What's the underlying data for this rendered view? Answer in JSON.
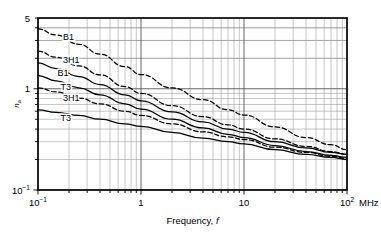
{
  "chart_data": {
    "type": "line",
    "title": "",
    "xlabel": "Frequency, f",
    "ylabel": "n_a",
    "xlabel_text": "Frequency,",
    "xlabel_symbol": "f",
    "xscale": "log",
    "yscale": "log",
    "xlim": [
      0.1,
      100
    ],
    "ylim": [
      0.1,
      5
    ],
    "xunit": "MHz",
    "grid": true,
    "legend_position": "inline-labels",
    "xticks": [
      {
        "value": 0.1,
        "label": "10",
        "sup": "-1"
      },
      {
        "value": 1,
        "label": "1",
        "sup": ""
      },
      {
        "value": 10,
        "label": "10",
        "sup": ""
      },
      {
        "value": 100,
        "label": "10",
        "sup": "2"
      }
    ],
    "yticks": [
      {
        "value": 5,
        "label": "5",
        "sup": ""
      },
      {
        "value": 1,
        "label": "1",
        "sup": ""
      },
      {
        "value": 0.1,
        "label": "10",
        "sup": "-1"
      }
    ],
    "series": [
      {
        "name": "B1",
        "style": "dashed",
        "label": "B1",
        "label_x": 0.175,
        "label_y": 3.05,
        "x": [
          0.1,
          0.15,
          0.25,
          0.4,
          0.7,
          1.0,
          2.0,
          4.0,
          7.0,
          10.0,
          20.0,
          40.0,
          70.0,
          100.0
        ],
        "y": [
          3.9,
          3.4,
          2.75,
          2.2,
          1.65,
          1.38,
          1.02,
          0.78,
          0.62,
          0.55,
          0.42,
          0.33,
          0.28,
          0.25
        ]
      },
      {
        "name": "3H1-upper",
        "style": "dashed",
        "label": "3H1",
        "label_x": 0.175,
        "label_y": 1.8,
        "x": [
          0.1,
          0.15,
          0.25,
          0.4,
          0.7,
          1.0,
          2.0,
          4.0,
          7.0,
          10.0,
          20.0,
          40.0,
          70.0,
          100.0
        ],
        "y": [
          2.35,
          2.05,
          1.68,
          1.37,
          1.05,
          0.9,
          0.68,
          0.53,
          0.44,
          0.4,
          0.32,
          0.27,
          0.24,
          0.225
        ]
      },
      {
        "name": "B1-solid",
        "style": "solid",
        "label": "B1",
        "label_x": 0.155,
        "label_y": 1.34,
        "x": [
          0.1,
          0.15,
          0.25,
          0.4,
          0.7,
          1.0,
          2.0,
          4.0,
          7.0,
          10.0,
          20.0,
          40.0,
          70.0,
          100.0
        ],
        "y": [
          1.8,
          1.58,
          1.32,
          1.1,
          0.87,
          0.76,
          0.59,
          0.47,
          0.4,
          0.37,
          0.3,
          0.26,
          0.235,
          0.225
        ]
      },
      {
        "name": "T3-upper",
        "style": "solid",
        "label": "T3",
        "label_x": 0.165,
        "label_y": 0.98,
        "x": [
          0.1,
          0.15,
          0.25,
          0.4,
          0.7,
          1.0,
          2.0,
          4.0,
          7.0,
          10.0,
          20.0,
          40.0,
          70.0,
          100.0
        ],
        "y": [
          1.35,
          1.2,
          1.02,
          0.87,
          0.71,
          0.63,
          0.5,
          0.41,
          0.355,
          0.33,
          0.275,
          0.24,
          0.22,
          0.21
        ]
      },
      {
        "name": "3H1-lower",
        "style": "dashed",
        "label": "3H1",
        "label_x": 0.175,
        "label_y": 0.76,
        "x": [
          0.1,
          0.15,
          0.25,
          0.4,
          0.7,
          1.0,
          2.0,
          4.0,
          7.0,
          10.0,
          20.0,
          40.0,
          70.0,
          100.0
        ],
        "y": [
          1.02,
          0.93,
          0.81,
          0.71,
          0.6,
          0.545,
          0.45,
          0.375,
          0.335,
          0.315,
          0.265,
          0.235,
          0.215,
          0.205
        ]
      },
      {
        "name": "T3-lower",
        "style": "solid",
        "label": "T3",
        "label_x": 0.165,
        "label_y": 0.48,
        "x": [
          0.1,
          0.15,
          0.25,
          0.4,
          0.7,
          1.0,
          2.0,
          4.0,
          7.0,
          10.0,
          20.0,
          40.0,
          70.0,
          100.0
        ],
        "y": [
          0.62,
          0.585,
          0.545,
          0.5,
          0.45,
          0.425,
          0.37,
          0.325,
          0.3,
          0.285,
          0.25,
          0.225,
          0.21,
          0.2
        ]
      }
    ],
    "colors": {
      "axis": "#000000",
      "grid_major": "#555555",
      "grid_minor": "#8c8c8c",
      "curve": "#000000"
    }
  }
}
